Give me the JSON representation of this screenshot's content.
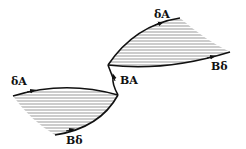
{
  "diagram": {
    "labels": {
      "lower_top": "δA",
      "lower_bottom": "Bδ",
      "connector": "BA",
      "upper_top": "δA",
      "upper_bottom": "Bδ"
    },
    "colors": {
      "stroke": "#111111",
      "hatch": "#555555",
      "background": "#ffffff"
    }
  }
}
